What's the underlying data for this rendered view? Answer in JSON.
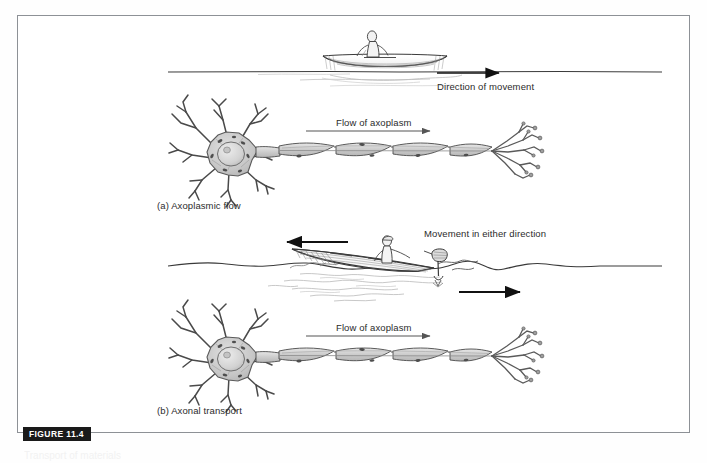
{
  "figure": {
    "tag": "FIGURE 11.4",
    "caption_partial": "Transport of materials"
  },
  "labels": {
    "direction_of_movement": "Direction of movement",
    "flow_of_axoplasm_a": "Flow of axoplasm",
    "flow_of_axoplasm_b": "Flow of axoplasm",
    "movement_either_direction": "Movement in either direction",
    "panel_a": "(a)  Axoplasmic flow",
    "panel_b": "(b)  Axonal transport"
  },
  "panels": [
    {
      "id": "a",
      "label": "(a)  Axoplasmic flow",
      "analogy": "rowboat-on-water",
      "boat_type": "rowboat",
      "rower_posture": "seated",
      "arrow_directions": [
        "right"
      ],
      "arrow_label": "Direction of movement",
      "neuron_arrow_label": "Flow of axoplasm",
      "neuron_arrow_direction": "right"
    },
    {
      "id": "b",
      "label": "(b)  Axonal transport",
      "analogy": "motorboat-on-water",
      "boat_type": "motorboat-with-outboard",
      "rower_posture": "standing",
      "arrow_directions": [
        "left",
        "right"
      ],
      "arrow_label": "Movement in either direction",
      "neuron_arrow_label": "Flow of axoplasm",
      "neuron_arrow_direction": "right"
    }
  ],
  "colors": {
    "frame_border": "#8d9196",
    "ink": "#2b2b2b",
    "line": "#3a3a3a",
    "soma_fill": "#c9c9c9",
    "nucleus_fill": "#d7d7d7",
    "axon_fill": "#d2d2d2",
    "water_ripple": "#b9b9b9",
    "tag_background": "#1a1a1a",
    "tag_text": "#ffffff"
  }
}
